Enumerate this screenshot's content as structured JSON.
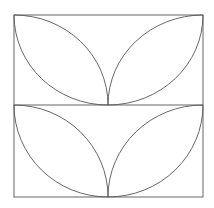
{
  "figure": {
    "title": "Leaf pattern tile",
    "stroke_color": "#555555",
    "background_color": "#ffffff",
    "square": {
      "x1": 14,
      "y1": 15,
      "x2": 203,
      "y2": 197
    },
    "divider_y": 105,
    "center_x": 108
  }
}
